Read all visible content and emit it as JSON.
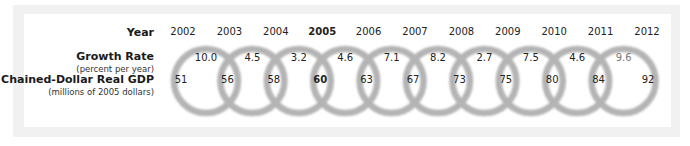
{
  "labels": {
    "year": "Year",
    "growth_rate": "Growth Rate",
    "growth_rate_unit": "(percent per year)",
    "gdp": "Chained-Dollar Real GDP",
    "gdp_unit": "(millions of 2005 dollars)"
  },
  "base_year": "2005",
  "years": [
    "2002",
    "2003",
    "2004",
    "2005",
    "2006",
    "2007",
    "2008",
    "2009",
    "2010",
    "2011",
    "2012"
  ],
  "growth_rates": [
    "10.0",
    "4.5",
    "3.2",
    "4.6",
    "7.1",
    "8.2",
    "2.7",
    "7.5",
    "4.6",
    "9.6"
  ],
  "gdp_values": [
    "51",
    "56",
    "58",
    "60",
    "63",
    "67",
    "73",
    "75",
    "80",
    "84",
    "92"
  ],
  "colors": {
    "ring": "#b4b4b4",
    "frame": "#f1f1f1",
    "text": "#222222",
    "projected_text": "#777777"
  },
  "chart_data": {
    "type": "table",
    "title": "",
    "rows": [
      {
        "label": "Year",
        "values": [
          "2002",
          "2003",
          "2004",
          "2005",
          "2006",
          "2007",
          "2008",
          "2009",
          "2010",
          "2011",
          "2012"
        ]
      },
      {
        "label": "Growth Rate (percent per year)",
        "values": [
          10.0,
          4.5,
          3.2,
          4.6,
          7.1,
          8.2,
          2.7,
          7.5,
          4.6,
          9.6
        ]
      },
      {
        "label": "Chained-Dollar Real GDP (millions of 2005 dollars)",
        "values": [
          51,
          56,
          58,
          60,
          63,
          67,
          73,
          75,
          80,
          84,
          92
        ]
      }
    ],
    "highlight": "2005"
  }
}
